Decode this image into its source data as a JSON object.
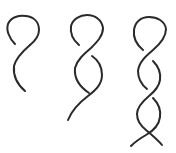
{
  "diagram": {
    "type": "twist-progression",
    "background": "#ffffff",
    "stroke_color": "#2a2a2a",
    "figures": [
      {
        "id": "single-loop",
        "crossings": 1
      },
      {
        "id": "double-twist",
        "crossings": 2
      },
      {
        "id": "multi-twist-braid",
        "crossings": 4
      }
    ]
  }
}
